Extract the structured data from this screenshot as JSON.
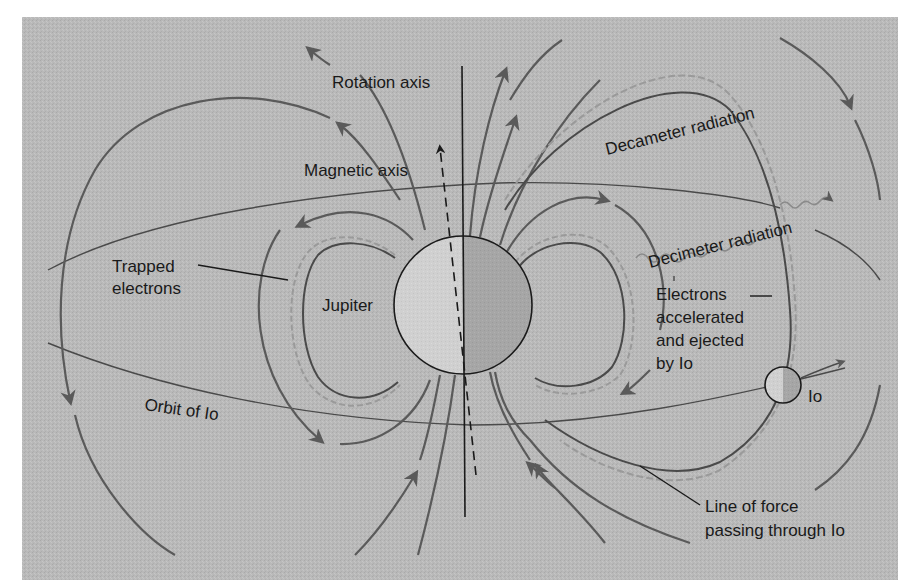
{
  "figure": {
    "colors": {
      "page_background": "#ffffff",
      "panel_background": "#b9b9b9",
      "field_line": "#5a5a5a",
      "trapped_electron_coil": "#9a9a9a",
      "jupiter_light_half": "#d0d0d0",
      "jupiter_dark_half": "#a6a6a6",
      "text": "#1a1a1a"
    },
    "labels": {
      "rotation_axis": "Rotation axis",
      "magnetic_axis": "Magnetic axis",
      "decameter_radiation": "Decameter radiation",
      "decimeter_radiation": "Decimeter radiation",
      "trapped_electrons_line1": "Trapped",
      "trapped_electrons_line2": "electrons",
      "jupiter": "Jupiter",
      "electrons_line1": "Electrons",
      "electrons_line2": "accelerated",
      "electrons_line3": "and ejected",
      "electrons_line4": "by Io",
      "io": "Io",
      "orbit_of_io": "Orbit of Io",
      "line_of_force_line1": "Line of force",
      "line_of_force_line2": "passing through Io"
    },
    "elements": {
      "planet": "Jupiter (large sphere, half shaded)",
      "moon": "Io (small sphere on orbit, half shaded)",
      "axes": [
        "rotation axis (solid vertical line)",
        "magnetic axis (dashed tilted line with arrow)"
      ],
      "features": [
        "dipole magnetic field lines with arrows",
        "trapped electron belts (coiled)",
        "orbit of Io (ellipse)",
        "wavy radiation arrows"
      ]
    }
  }
}
